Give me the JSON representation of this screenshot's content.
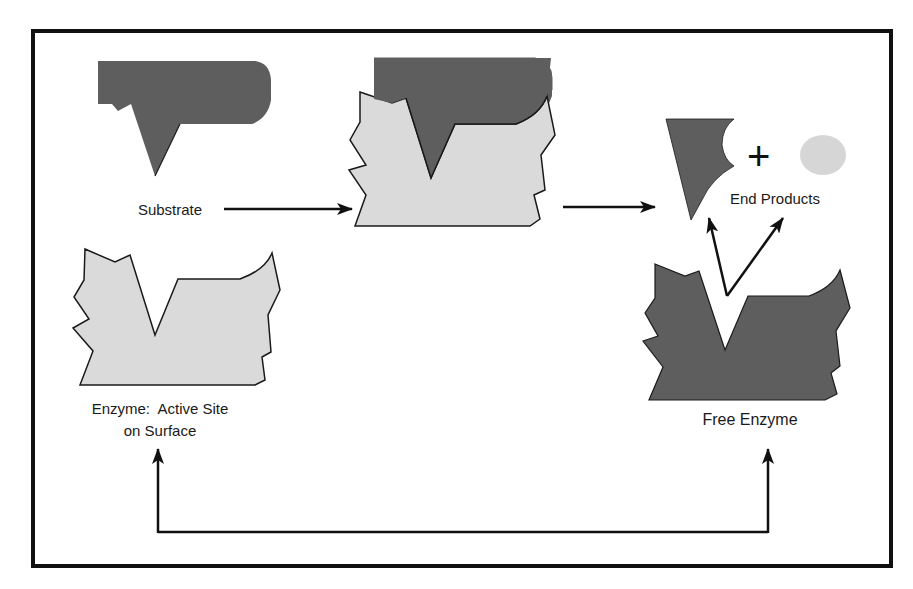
{
  "diagram": {
    "labels": {
      "substrate": "Substrate",
      "end_products": "End Products",
      "enzyme_line1": "Enzyme:  Active Site",
      "enzyme_line2": "on Surface",
      "free_enzyme": "Free Enzyme",
      "plus": "+"
    },
    "colors": {
      "dark_shape": "#5e5e5e",
      "light_shape": "#dadada",
      "outline": "#1a1a1a",
      "frame": "#111111",
      "background": "#ffffff"
    },
    "nodes": [
      {
        "id": "substrate",
        "label": "Substrate",
        "fill": "dark"
      },
      {
        "id": "enzyme",
        "label": "Enzyme: Active Site on Surface",
        "fill": "light"
      },
      {
        "id": "enzyme-substrate-complex",
        "label": "",
        "fill": "light+dark"
      },
      {
        "id": "end-products",
        "label": "End Products",
        "fill": "dark+light"
      },
      {
        "id": "free-enzyme",
        "label": "Free Enzyme",
        "fill": "dark"
      }
    ],
    "edges": [
      {
        "from": "substrate",
        "to": "enzyme-substrate-complex"
      },
      {
        "from": "enzyme-substrate-complex",
        "to": "end-products"
      },
      {
        "from": "free-enzyme",
        "to": "end-products"
      },
      {
        "from": "free-enzyme",
        "to": "enzyme",
        "note": "recycle loop"
      }
    ]
  }
}
